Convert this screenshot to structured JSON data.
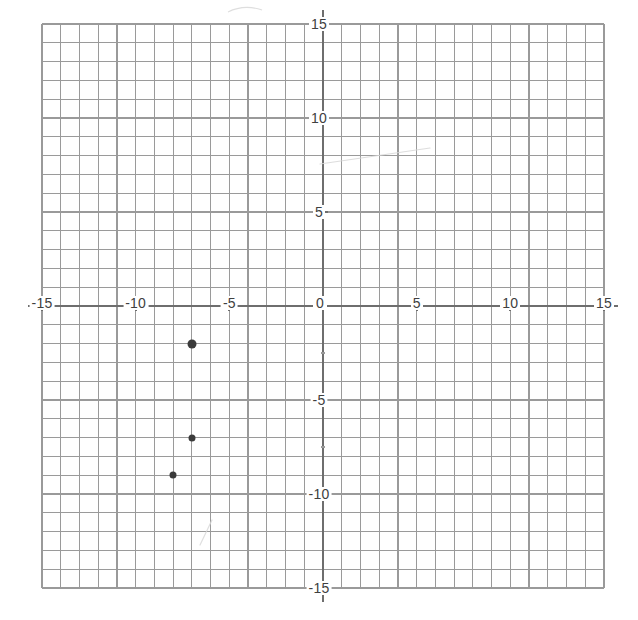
{
  "chart_data": {
    "type": "scatter",
    "title": "",
    "xlabel": "",
    "ylabel": "",
    "xlim": [
      -15,
      15
    ],
    "ylim": [
      -15,
      15
    ],
    "grid": true,
    "grid_step": 1,
    "tick_step": 5,
    "legend": "none",
    "x_tick_labels": [
      "-15",
      "-10",
      "-5",
      "0",
      "5",
      "10",
      "15"
    ],
    "y_tick_labels": [
      "15",
      "10",
      "5",
      "0",
      "-5",
      "-10",
      "-15"
    ],
    "x_ticks": [
      -15,
      -10,
      -5,
      0,
      5,
      10,
      15
    ],
    "y_ticks": [
      15,
      10,
      5,
      0,
      -5,
      -10,
      -15
    ],
    "points": [
      {
        "label": "point-1",
        "x": -7,
        "y": -2,
        "radius": 4.5
      },
      {
        "label": "point-2",
        "x": -7,
        "y": -7,
        "radius": 3.5
      },
      {
        "label": "point-3",
        "x": -8,
        "y": -9,
        "radius": 3.5
      }
    ],
    "series": [
      {
        "name": "plotted points",
        "x": [
          -7,
          -7,
          -8
        ],
        "values": [
          -2,
          -7,
          -9
        ]
      }
    ]
  },
  "colors": {
    "grid_line": "#8d8d8d",
    "minor_grid_line": "#9a9a9a",
    "axis_line": "#6e6e6e",
    "point_fill": "#3b3b3b",
    "label_text": "#404040",
    "background": "#ffffff",
    "artifact": "#d8d8d8"
  },
  "labels": {
    "x_axis_left_15": "-15",
    "x_axis_left_10": "-10",
    "x_axis_left_5": "-5",
    "origin": "0",
    "x_axis_right_5": "5",
    "x_axis_right_10": "10",
    "x_axis_right_15": "15",
    "y_axis_top_15": "15",
    "y_axis_top_10": "10",
    "y_axis_top_5": "5",
    "y_axis_bottom_5": "-5",
    "y_axis_bottom_10": "-10",
    "y_axis_bottom_15": "-15"
  },
  "geometry": {
    "grid_left": 42,
    "grid_top": 24,
    "grid_right": 604,
    "grid_bottom": 588,
    "cell_size": 18.73,
    "origin_x": 323,
    "origin_y": 306
  }
}
